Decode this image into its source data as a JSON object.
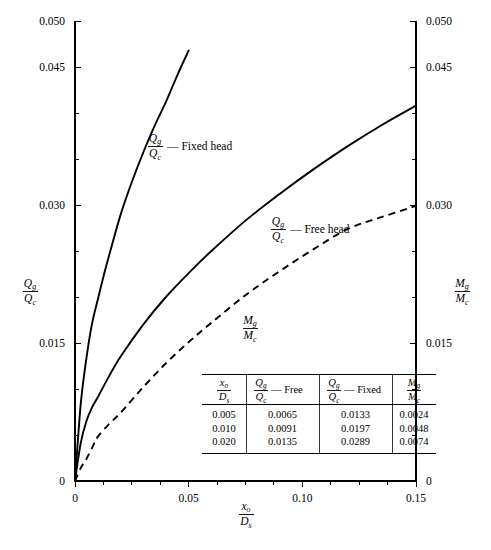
{
  "chart_data": {
    "type": "line",
    "title": "",
    "xlabel": "x_o / D_s",
    "ylabel": "Q_g / Q_c",
    "ylabel_right": "M_g / M_c",
    "xlim": [
      0,
      0.15
    ],
    "ylim": [
      0,
      0.05
    ],
    "grid": false,
    "legend_position": "inline-annotations",
    "x_ticks_major": [
      0,
      0.05,
      0.1,
      0.15
    ],
    "x_ticklabels": [
      "0",
      "0.05",
      "0.10",
      "0.15"
    ],
    "x_ticks_minor": [
      0.0125,
      0.025,
      0.0375,
      0.0625,
      0.075,
      0.0875,
      0.1125,
      0.125,
      0.1375
    ],
    "y_ticks_labeled": [
      0,
      0.015,
      0.03,
      0.045,
      0.05
    ],
    "y_ticklabels": [
      "0",
      "0.015",
      "0.030",
      "0.045",
      "0.050"
    ],
    "y_ticks_minor": [
      0.005,
      0.01,
      0.02,
      0.025,
      0.035,
      0.04
    ],
    "y_ticklabels_right": [
      "0",
      "0.015",
      "0.030",
      "0.045",
      "0.050"
    ],
    "series": [
      {
        "name": "Qg/Qc — Fixed head",
        "style": "solid",
        "x": [
          0,
          0.0025,
          0.005,
          0.0075,
          0.01,
          0.0125,
          0.015,
          0.02,
          0.025,
          0.03,
          0.035,
          0.04,
          0.045,
          0.05
        ],
        "y": [
          0,
          0.0083,
          0.0133,
          0.0171,
          0.0197,
          0.0222,
          0.0245,
          0.0289,
          0.0325,
          0.0357,
          0.0386,
          0.0412,
          0.0441,
          0.0468
        ]
      },
      {
        "name": "Qg/Qc — Free head",
        "style": "solid",
        "x": [
          0,
          0.0025,
          0.005,
          0.0075,
          0.01,
          0.015,
          0.02,
          0.03,
          0.04,
          0.05,
          0.06,
          0.075,
          0.09,
          0.105,
          0.12,
          0.135,
          0.15
        ],
        "y": [
          0,
          0.0041,
          0.0065,
          0.008,
          0.0091,
          0.0114,
          0.0135,
          0.017,
          0.02,
          0.0226,
          0.025,
          0.0283,
          0.0312,
          0.0339,
          0.0364,
          0.0387,
          0.0408
        ]
      },
      {
        "name": "Mg/Mc",
        "style": "dashed",
        "x": [
          0,
          0.0025,
          0.005,
          0.0075,
          0.01,
          0.015,
          0.02,
          0.03,
          0.04,
          0.05,
          0.06,
          0.075,
          0.09,
          0.105,
          0.12,
          0.135,
          0.15
        ],
        "y": [
          0,
          0.0014,
          0.0024,
          0.0036,
          0.0048,
          0.0062,
          0.0074,
          0.0102,
          0.0128,
          0.0151,
          0.0172,
          0.0202,
          0.0228,
          0.0252,
          0.0274,
          0.0287,
          0.0299
        ]
      }
    ],
    "annotations": [
      {
        "id": "fixed-head-label",
        "numerator": "Q",
        "num_sub": "g",
        "denominator": "Q",
        "den_sub": "c",
        "text": "— Fixed head",
        "x_px": 155,
        "y_px": 145
      },
      {
        "id": "free-head-label",
        "numerator": "Q",
        "num_sub": "g",
        "denominator": "Q",
        "den_sub": "c",
        "text": "— Free head",
        "x_px": 278,
        "y_px": 228
      },
      {
        "id": "moment-label",
        "numerator": "M",
        "num_sub": "g",
        "denominator": "M",
        "den_sub": "c",
        "text": "",
        "x_px": 250,
        "y_px": 327
      }
    ],
    "table": {
      "headers": [
        {
          "numerator": "x",
          "num_sub": "o",
          "denominator": "D",
          "den_sub": "s",
          "suffix": ""
        },
        {
          "numerator": "Q",
          "num_sub": "g",
          "denominator": "Q",
          "den_sub": "c",
          "suffix": "— Free"
        },
        {
          "numerator": "Q",
          "num_sub": "g",
          "denominator": "Q",
          "den_sub": "c",
          "suffix": "— Fixed"
        },
        {
          "numerator": "M",
          "num_sub": "g",
          "denominator": "M",
          "den_sub": "c",
          "suffix": ""
        }
      ],
      "rows": [
        [
          "0.005",
          "0.0065",
          "0.0133",
          "0.0024"
        ],
        [
          "0.010",
          "0.0091",
          "0.0197",
          "0.0048"
        ],
        [
          "0.020",
          "0.0135",
          "0.0289",
          "0.0074"
        ]
      ]
    },
    "axis_titles": {
      "left": {
        "numerator": "Q",
        "num_sub": "g",
        "denominator": "Q",
        "den_sub": "c"
      },
      "right": {
        "numerator": "M",
        "num_sub": "g",
        "denominator": "M",
        "den_sub": "c"
      },
      "bottom": {
        "numerator": "x",
        "num_sub": "o",
        "denominator": "D",
        "den_sub": "s"
      }
    }
  },
  "colors": {
    "ink": "#000000",
    "background": "#ffffff"
  }
}
